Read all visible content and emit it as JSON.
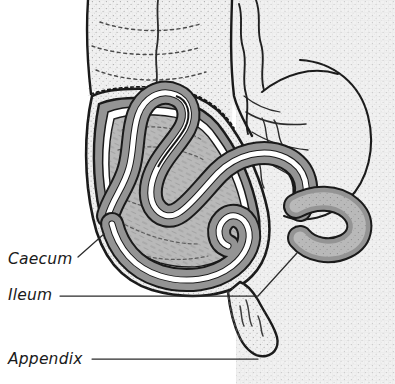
{
  "figure": {
    "width": 395,
    "height": 384,
    "background_color": "#ffffff",
    "tissue_background_color": "#f0f0f0",
    "ink_color": "#1a1a1a"
  },
  "palette": {
    "outline": "#1a1a1a",
    "background_tissue": "#f0f0f0",
    "muscle_layer": "#949494",
    "mucosa_layer": "#b9b9b9",
    "lumen": "#ffffff",
    "cutaway_white": "#ffffff",
    "leader_line": "#2b2b2b"
  },
  "labels": [
    {
      "id": "caecum",
      "text": "Caecum",
      "x": 8,
      "y": 264,
      "leader": {
        "type": "diagonal",
        "points": "78,257 104,235"
      }
    },
    {
      "id": "ileum",
      "text": "Ileum",
      "x": 8,
      "y": 300,
      "leader": {
        "type": "horizontal-then-diagonal",
        "points": "60,296 258,296 297,254"
      }
    },
    {
      "id": "appendix",
      "text": "Appendix",
      "x": 8,
      "y": 364,
      "leader": {
        "type": "horizontal",
        "points": "92,359 258,359"
      }
    }
  ],
  "structures": [
    {
      "id": "ascending-colon",
      "name": "Ascending colon",
      "shading": "stippled-light"
    },
    {
      "id": "caecum",
      "name": "Caecum",
      "shading": "mucosa-gray"
    },
    {
      "id": "ileum",
      "name": "Ileum",
      "shading": "muscle-gray"
    },
    {
      "id": "ileocaecal-valve",
      "name": "Ileocaecal valve",
      "shading": "muscle-gray"
    },
    {
      "id": "appendix",
      "name": "Appendix",
      "shading": "stippled-light"
    },
    {
      "id": "mesentery",
      "name": "Mesentery",
      "shading": "stippled-light"
    }
  ]
}
